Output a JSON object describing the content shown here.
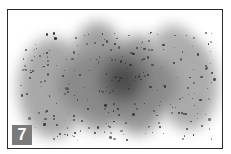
{
  "figure": {
    "badge_label": "7",
    "colors": {
      "frame": "#2a2a2a",
      "cloud": "#9a9a9a",
      "core": "#3a3a3a",
      "badge": "#7a7a7a",
      "badge_text": "#ffffff"
    }
  }
}
